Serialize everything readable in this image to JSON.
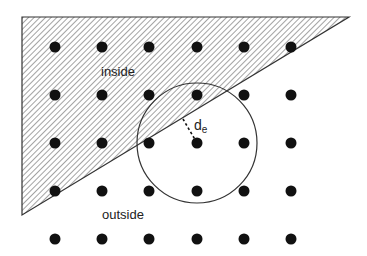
{
  "diagram": {
    "labels": {
      "inside": "inside",
      "outside": "outside",
      "distance_main": "d",
      "distance_sub": "e"
    },
    "region": {
      "shape": "right-triangle",
      "fill": "diagonal-hatch",
      "vertices": [
        [
          22,
          17
        ],
        [
          349,
          17
        ],
        [
          22,
          215
        ]
      ]
    },
    "grid": {
      "columns_x": [
        55,
        102,
        149,
        197,
        244,
        291
      ],
      "rows_y": [
        47,
        95,
        143,
        191,
        239
      ],
      "dot_radius": 5.5
    },
    "circle": {
      "cx": 197,
      "cy": 143,
      "r": 60
    },
    "distance_line": {
      "x1": 183,
      "y1": 119,
      "x2": 197,
      "y2": 143
    },
    "colors": {
      "stroke": "#333333",
      "dot": "#111111",
      "hatch": "#555555"
    }
  }
}
